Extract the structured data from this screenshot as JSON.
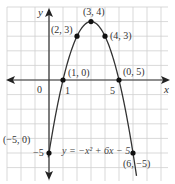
{
  "chart_data": {
    "type": "line",
    "title": "",
    "xlabel": "x",
    "ylabel": "y",
    "equation": "y = −x² + 6x − 5",
    "xlim": [
      -3,
      8
    ],
    "ylim": [
      -7,
      5
    ],
    "grid": true,
    "tick_labels": {
      "origin": "0",
      "x1": "1",
      "x5": "5",
      "yneg5": "−5"
    },
    "series": [
      {
        "name": "y = −x² + 6x − 5",
        "curve": "parabola",
        "a": -1,
        "b": 6,
        "c": -5,
        "x": [
          0,
          1,
          2,
          3,
          4,
          5,
          6
        ],
        "y": [
          -5,
          0,
          3,
          4,
          3,
          0,
          -5
        ]
      }
    ],
    "points": [
      {
        "x": 0,
        "y": -5,
        "label": "(−5, 0)"
      },
      {
        "x": 1,
        "y": 0,
        "label": "(1, 0)"
      },
      {
        "x": 2,
        "y": 3,
        "label": "(2, 3)"
      },
      {
        "x": 3,
        "y": 4,
        "label": "(3, 4)"
      },
      {
        "x": 4,
        "y": 3,
        "label": "(4, 3)"
      },
      {
        "x": 5,
        "y": 0,
        "label": "(0, 5)"
      },
      {
        "x": 6,
        "y": -5,
        "label": "(6, −5)"
      }
    ],
    "colors": {
      "grid": "#cfcfcf",
      "axis": "#333333",
      "curve": "#333333",
      "point": "#111111"
    }
  }
}
